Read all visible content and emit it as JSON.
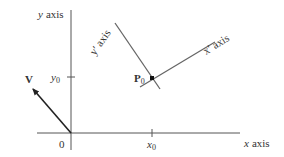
{
  "diagram": {
    "title": "",
    "labels": {
      "y_axis": "y axis",
      "x_axis": "x axis",
      "y_prime_axis": "y′ axis",
      "x_prime_axis": "x′ axis",
      "origin": "0",
      "y0_var": "y",
      "y0_sub": "0",
      "x0_var": "x",
      "x0_sub": "0",
      "vector": "V",
      "point_var": "P",
      "point_sub": "0"
    },
    "colors": {
      "axis": "#555555",
      "vector": "#222222",
      "point": "#111111",
      "text": "#333333"
    },
    "elements": [
      {
        "id": "x-axis",
        "type": "line",
        "from": [
          37,
          133
        ],
        "to": [
          240,
          133
        ]
      },
      {
        "id": "y-axis",
        "type": "line",
        "from": [
          71,
          10
        ],
        "to": [
          71,
          150
        ]
      },
      {
        "id": "vector-V",
        "type": "arrow",
        "from": [
          71,
          133
        ],
        "to": [
          32,
          88
        ]
      },
      {
        "id": "y-prime-axis",
        "type": "line",
        "from": [
          115,
          23
        ],
        "to": [
          160,
          89
        ]
      },
      {
        "id": "x-prime-axis",
        "type": "line",
        "from": [
          140,
          87
        ],
        "to": [
          215,
          42
        ]
      },
      {
        "id": "point-P0",
        "type": "point",
        "at": [
          152,
          78
        ]
      },
      {
        "id": "tick-x0",
        "type": "tick",
        "at": [
          152,
          133
        ]
      },
      {
        "id": "tick-y0",
        "type": "tick",
        "at": [
          71,
          77
        ]
      }
    ]
  }
}
